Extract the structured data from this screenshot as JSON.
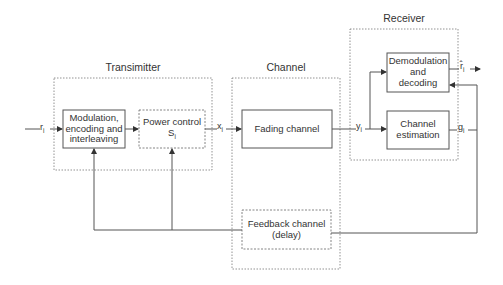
{
  "colors": {
    "line": "#555555",
    "text": "#333333",
    "frame": "#777777",
    "background": "#ffffff"
  },
  "groups": {
    "transmitter": {
      "title": "Transimitter"
    },
    "channel": {
      "title": "Channel"
    },
    "receiver": {
      "title": "Receiver"
    }
  },
  "blocks": {
    "modulation": {
      "line1": "Modulation,",
      "line2": "encoding and",
      "line3": "interleaving",
      "style": "solid"
    },
    "power_control": {
      "line1": "Power control",
      "line2": "S",
      "line2_sub": "i",
      "style": "dashed"
    },
    "fading_channel": {
      "line1": "Fading channel",
      "style": "solid"
    },
    "feedback_channel": {
      "line1": "Feedback channel",
      "line2": "(delay)",
      "style": "dashed"
    },
    "demodulation": {
      "line1": "Demodulation",
      "line2": "and",
      "line3": "decoding",
      "style": "solid"
    },
    "channel_estimation": {
      "line1": "Channel",
      "line2": "estimation",
      "style": "solid"
    }
  },
  "signals": {
    "input": {
      "base": "r",
      "sub": "i"
    },
    "tx_output": {
      "base": "x",
      "sub": "i"
    },
    "rx_input": {
      "base": "y",
      "sub": "i"
    },
    "estimate": {
      "base": "g",
      "sub": "i"
    },
    "output": {
      "base": "r̂",
      "sub": "i"
    }
  }
}
